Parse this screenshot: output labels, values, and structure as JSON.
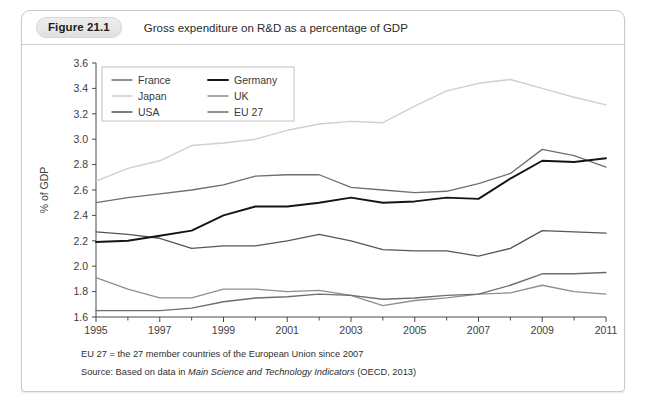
{
  "figure": {
    "badge": "Figure 21.1",
    "title": "Gross expenditure on R&D as a percentage of GDP",
    "footnote_1": "EU 27 = the 27 member countries of the European Union since 2007",
    "footnote_2_prefix": "Source: Based on data in ",
    "footnote_2_italic": "Main Science and Technology Indicators",
    "footnote_2_suffix": " (OECD, 2013)"
  },
  "chart_data": {
    "type": "line",
    "title": "Gross expenditure on R&D as a percentage of GDP",
    "xlabel": "",
    "ylabel": "% of GDP",
    "xlim": [
      1995,
      2011
    ],
    "ylim": [
      1.6,
      3.6
    ],
    "ytick_step": 0.2,
    "xtick_step": 2,
    "x": [
      1995,
      1996,
      1997,
      1998,
      1999,
      2000,
      2001,
      2002,
      2003,
      2004,
      2005,
      2006,
      2007,
      2008,
      2009,
      2010,
      2011
    ],
    "xticks": [
      1995,
      1997,
      1999,
      2001,
      2003,
      2005,
      2007,
      2009,
      2011
    ],
    "yticks": [
      1.6,
      1.8,
      2.0,
      2.2,
      2.4,
      2.6,
      2.8,
      3.0,
      3.2,
      3.4,
      3.6
    ],
    "grid": false,
    "legend_position": "top-left",
    "series": [
      {
        "name": "France",
        "color": "#6e6e6e",
        "width": 1.3,
        "values": [
          2.5,
          2.54,
          2.57,
          2.6,
          2.64,
          2.71,
          2.72,
          2.72,
          2.62,
          2.6,
          2.58,
          2.59,
          2.65,
          2.73,
          2.92,
          2.87,
          2.78
        ]
      },
      {
        "name": "Japan",
        "color": "#cfcfcf",
        "width": 1.4,
        "values": [
          2.67,
          2.77,
          2.83,
          2.95,
          2.97,
          3.0,
          3.07,
          3.12,
          3.14,
          3.13,
          3.26,
          3.38,
          3.44,
          3.47,
          3.4,
          3.33,
          3.27
        ]
      },
      {
        "name": "USA",
        "color": "#565656",
        "width": 1.3,
        "values": [
          2.27,
          2.25,
          2.22,
          2.14,
          2.16,
          2.16,
          2.2,
          2.25,
          2.2,
          2.13,
          2.12,
          2.12,
          2.08,
          2.14,
          2.28,
          2.27,
          2.26
        ]
      },
      {
        "name": "Germany",
        "color": "#151515",
        "width": 1.9,
        "values": [
          2.19,
          2.2,
          2.24,
          2.28,
          2.4,
          2.47,
          2.47,
          2.5,
          2.54,
          2.5,
          2.51,
          2.54,
          2.53,
          2.69,
          2.83,
          2.82,
          2.85
        ]
      },
      {
        "name": "UK",
        "color": "#8e8e8e",
        "width": 1.3,
        "values": [
          1.91,
          1.82,
          1.75,
          1.75,
          1.82,
          1.82,
          1.8,
          1.81,
          1.77,
          1.69,
          1.73,
          1.75,
          1.78,
          1.79,
          1.85,
          1.8,
          1.78
        ]
      },
      {
        "name": "EU 27",
        "color": "#6e6e6e",
        "width": 1.4,
        "values": [
          1.65,
          1.65,
          1.65,
          1.67,
          1.72,
          1.75,
          1.76,
          1.78,
          1.77,
          1.74,
          1.75,
          1.77,
          1.78,
          1.85,
          1.94,
          1.94,
          1.95
        ]
      }
    ],
    "legend_columns": [
      [
        "France",
        "Japan",
        "USA"
      ],
      [
        "Germany",
        "UK",
        "EU 27"
      ]
    ]
  }
}
